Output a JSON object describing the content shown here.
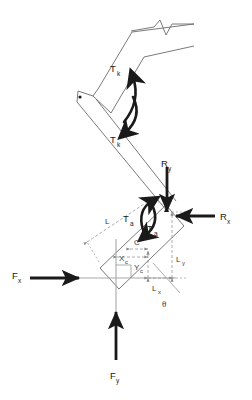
{
  "diagram": {
    "type": "engineering-free-body-diagram",
    "background_color": "#ffffff",
    "line_color_member": "#6b6b6b",
    "line_color_force": "#1a1a1a",
    "line_color_dimension": "#8a8a8a",
    "line_color_axis": "#9a9a9a"
  },
  "labels": {
    "torque_knee_upper": {
      "base": "T",
      "sub": "k"
    },
    "torque_knee_lower": {
      "base": "T",
      "sub": "k"
    },
    "torque_ankle_upper": {
      "base": "T",
      "sub": "a"
    },
    "torque_ankle_lower": {
      "base": "T",
      "sub": "a"
    },
    "reaction_y": {
      "base": "R",
      "sub": "y"
    },
    "reaction_x": {
      "base": "R",
      "sub": "x"
    },
    "force_x": {
      "base": "F",
      "sub": "x"
    },
    "force_y": {
      "base": "F",
      "sub": "y"
    },
    "length_L": {
      "base": "L",
      "sub": ""
    },
    "length_Ly": {
      "base": "L",
      "sub": "y"
    },
    "length_Lx": {
      "base": "L",
      "sub": "x"
    },
    "centroid_x": {
      "base": "X",
      "sub": "c"
    },
    "centroid_y": {
      "base": "Y",
      "sub": "c"
    },
    "centroid_C": {
      "base": "C",
      "sub": ""
    },
    "angle_theta": {
      "base": "θ",
      "sub": ""
    }
  },
  "elements": {
    "pin_joint": "hinge-pin-dot",
    "break_symbol": "zigzag-beam-break",
    "upper_member": "thigh-segment",
    "lower_member": "shank-segment",
    "foot_member": "foot-segment"
  }
}
